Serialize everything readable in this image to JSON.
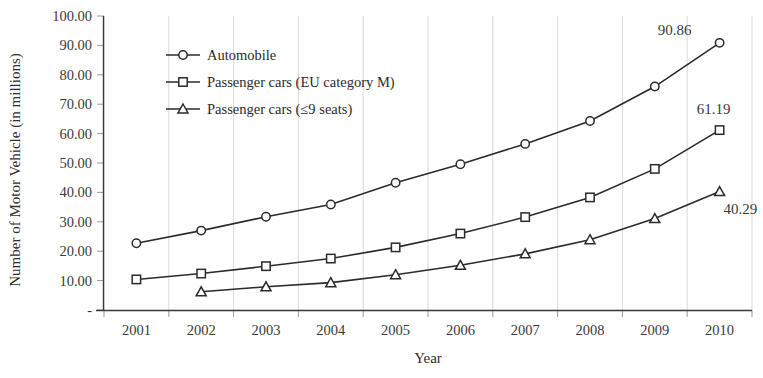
{
  "chart_data": {
    "type": "line",
    "title": "",
    "xlabel": "Year",
    "ylabel": "Number of Motor Vehicle (in millions)",
    "categories": [
      "2001",
      "2002",
      "2003",
      "2004",
      "2005",
      "2006",
      "2007",
      "2008",
      "2009",
      "2010"
    ],
    "x_tick_labels": [
      "2001",
      "2002",
      "2003",
      "2004",
      "2005",
      "2006",
      "2007",
      "2008",
      "2009",
      "2010"
    ],
    "y_tick_labels": [
      "100.00",
      "90.00",
      "80.00",
      "70.00",
      "60.00",
      "50.00",
      "40.00",
      "30.00",
      "20.00",
      "10.00",
      "-"
    ],
    "y_tick_values": [
      100,
      90,
      80,
      70,
      60,
      50,
      40,
      30,
      20,
      10,
      0
    ],
    "ylim": [
      0,
      100
    ],
    "grid": "vertical",
    "legend_position": "inside-top-left",
    "series": [
      {
        "name": "Automobile",
        "marker": "circle",
        "values": [
          22.7,
          27.0,
          31.7,
          35.9,
          43.3,
          49.6,
          56.5,
          64.3,
          76.0,
          90.86
        ],
        "end_label": "90.86"
      },
      {
        "name": "Passenger cars (EU category M)",
        "marker": "square",
        "values": [
          10.4,
          12.4,
          14.9,
          17.5,
          21.3,
          26.0,
          31.6,
          38.3,
          48.0,
          61.19
        ],
        "end_label": "61.19"
      },
      {
        "name": "Passenger cars (≤9 seats)",
        "marker": "triangle",
        "values": [
          null,
          6.2,
          7.9,
          9.3,
          12.0,
          15.2,
          19.1,
          23.9,
          31.1,
          40.29
        ],
        "end_label": "40.29"
      }
    ],
    "annotations": [
      {
        "text": "90.86",
        "series": "Automobile",
        "x": "2010"
      },
      {
        "text": "61.19",
        "series": "Passenger cars (EU category M)",
        "x": "2010"
      },
      {
        "text": "40.29",
        "series": "Passenger cars (≤9 seats)",
        "x": "2010"
      }
    ],
    "colors": {
      "line": "#2b2b2b",
      "marker_fill": "#ffffff",
      "marker_stroke": "#2b2b2b",
      "grid": "#d9d9d9",
      "axis": "#3a3a3a",
      "text": "#333333",
      "background": "#ffffff"
    }
  },
  "legend": {
    "items": [
      {
        "label": "Automobile",
        "marker": "circle"
      },
      {
        "label": "Passenger cars (EU category M)",
        "marker": "square"
      },
      {
        "label": "Passenger cars (≤9 seats)",
        "marker": "triangle"
      }
    ]
  },
  "axes": {
    "x_title": "Year",
    "y_title": "Number of Motor Vehicle (in millions)"
  }
}
